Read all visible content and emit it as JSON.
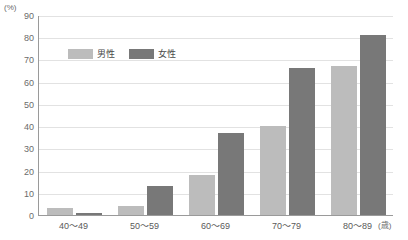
{
  "chart_data": {
    "type": "bar",
    "title": "",
    "subtitle": "",
    "xlabel": "歳",
    "ylabel": "(%)",
    "categories": [
      "40〜49",
      "50〜59",
      "60〜69",
      "70〜79",
      "80〜89"
    ],
    "series": [
      {
        "name": "男性",
        "color": "#bcbcbc",
        "values": [
          3,
          4,
          18,
          40,
          67
        ]
      },
      {
        "name": "女性",
        "color": "#787878",
        "values": [
          1,
          13,
          37,
          66,
          81
        ]
      }
    ],
    "ylim": [
      0,
      90
    ],
    "yticks": [
      0,
      10,
      20,
      30,
      40,
      50,
      60,
      70,
      80,
      90
    ],
    "ytick_labels": [
      "0",
      "10",
      "20",
      "30",
      "40",
      "50",
      "60",
      "70",
      "80",
      "90"
    ],
    "grid": true,
    "legend_position": "top-left",
    "unit_y": "(%)",
    "unit_x": "(歳)"
  }
}
